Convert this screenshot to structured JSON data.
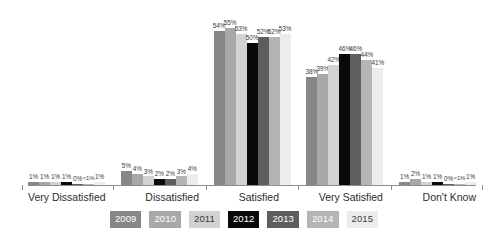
{
  "chart_data": {
    "type": "bar",
    "title": "",
    "subtitle": "",
    "xlabel": "",
    "ylabel": "",
    "grid": false,
    "legend_position": "bottom",
    "ylim": [
      0,
      60
    ],
    "categories": [
      "Very Dissatisfied",
      "Dissatisfied",
      "Satisfied",
      "Very Satisfied",
      "Don't Know"
    ],
    "series": [
      {
        "name": "2009",
        "color": "#878787",
        "text_color": "#ffffff",
        "values": [
          1,
          5,
          54,
          38,
          1
        ],
        "labels": [
          "1%",
          "5%",
          "54%",
          "38%",
          "1%"
        ]
      },
      {
        "name": "2010",
        "color": "#a8a8a8",
        "text_color": "#ffffff",
        "values": [
          1,
          4,
          55,
          39,
          2
        ],
        "labels": [
          "1%",
          "4%",
          "55%",
          "39%",
          "2%"
        ]
      },
      {
        "name": "2011",
        "color": "#d2d2d2",
        "text_color": "#3b3b3b",
        "values": [
          1,
          3,
          53,
          42,
          1
        ],
        "labels": [
          "1%",
          "3%",
          "53%",
          "42%",
          "1%"
        ]
      },
      {
        "name": "2012",
        "color": "#0a0a0a",
        "text_color": "#ffffff",
        "values": [
          1,
          2,
          50,
          46,
          1
        ],
        "labels": [
          "1%",
          "2%",
          "50%",
          "46%",
          "1%"
        ]
      },
      {
        "name": "2013",
        "color": "#5e5e5e",
        "text_color": "#ffffff",
        "values": [
          0,
          2,
          52,
          46,
          0
        ],
        "labels": [
          "0%",
          "2%",
          "52%",
          "46%",
          "0%"
        ]
      },
      {
        "name": "2014",
        "color": "#b5b5b5",
        "text_color": "#ffffff",
        "values": [
          0.4,
          3,
          52,
          44,
          0.4
        ],
        "labels": [
          "<1%",
          "3%",
          "52%",
          "44%",
          "<1%"
        ]
      },
      {
        "name": "2015",
        "color": "#ececec",
        "text_color": "#3b3b3b",
        "values": [
          1,
          4,
          53,
          41,
          1
        ],
        "labels": [
          "1%",
          "4%",
          "53%",
          "41%",
          "1%"
        ]
      }
    ]
  },
  "axis": {
    "baseline_color": "#8d8d8d"
  }
}
